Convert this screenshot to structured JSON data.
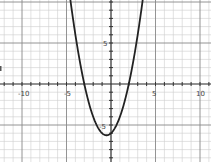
{
  "chart_data": {
    "type": "line",
    "title": "",
    "xlabel": "",
    "ylabel": "",
    "function": "y = x^2 + x - 6",
    "xlim": [
      -11.5,
      11.2
    ],
    "ylim": [
      -9.5,
      10.2
    ],
    "grid": true,
    "x_ticks_labeled": [
      -10,
      -5,
      5,
      10
    ],
    "y_ticks_labeled": [
      5,
      -5
    ],
    "x_tick_labels": [
      "-10",
      "-5",
      "5",
      "10"
    ],
    "y_tick_labels": [
      "5",
      "-5"
    ],
    "series": [
      {
        "name": "parabola",
        "x": [
          -4.5,
          -4,
          -3,
          -2,
          -1,
          -0.5,
          0,
          1,
          2,
          3,
          3.5
        ],
        "values": [
          9.75,
          6,
          0,
          -4,
          -6,
          -6.25,
          -6,
          -4,
          0,
          6,
          9.75
        ]
      }
    ],
    "roots": [
      -3,
      2
    ],
    "vertex": [
      -0.5,
      -6.25
    ],
    "colors": {
      "curve": "#222222",
      "axis": "#333333",
      "grid_major": "#888888",
      "grid_minor": "#cccccc"
    }
  }
}
